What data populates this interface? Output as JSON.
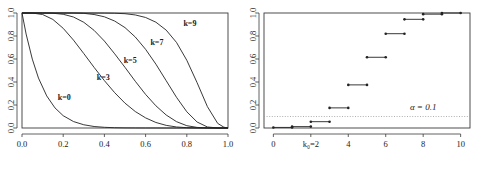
{
  "figure": {
    "background": "#ffffff",
    "ink_color": "#222222",
    "panel_count": 2
  },
  "chart_data": [
    {
      "type": "line",
      "panel": "left",
      "title": "",
      "xlabel": "",
      "ylabel": "",
      "xlim": [
        0.0,
        1.0
      ],
      "ylim": [
        0.0,
        1.0
      ],
      "grid": false,
      "legend": "inline-annotations",
      "xticks": [
        0.0,
        0.2,
        0.4,
        0.6,
        0.8,
        1.0
      ],
      "xtick_labels": [
        "0.0",
        "0.2",
        "0.4",
        "0.6",
        "0.8",
        "1.0"
      ],
      "yticks": [
        0.0,
        0.2,
        0.4,
        0.6,
        0.8,
        1.0
      ],
      "ytick_labels": [
        "0.0",
        "0.2",
        "0.4",
        "0.6",
        "0.8",
        "1.0"
      ],
      "annotations": [
        {
          "text": "k=0",
          "x": 0.205,
          "y": 0.245
        },
        {
          "text": "k=3",
          "x": 0.395,
          "y": 0.415
        },
        {
          "text": "k=5",
          "x": 0.525,
          "y": 0.565
        },
        {
          "text": "k=7",
          "x": 0.655,
          "y": 0.725
        },
        {
          "text": "k=9",
          "x": 0.815,
          "y": 0.885
        }
      ],
      "series": [
        {
          "name": "k=0",
          "x": [
            0.0,
            0.02,
            0.05,
            0.08,
            0.12,
            0.16,
            0.2,
            0.25,
            0.3,
            0.35,
            0.4,
            0.45,
            0.5,
            0.55,
            0.6,
            0.65,
            0.7,
            0.75,
            0.8,
            0.85,
            0.9,
            0.95,
            1.0
          ],
          "values": [
            1.0,
            0.817,
            0.599,
            0.434,
            0.279,
            0.175,
            0.107,
            0.056,
            0.028,
            0.013,
            0.006,
            0.0025,
            0.001,
            0.0004,
            0.0001,
            5e-05,
            2e-05,
            1e-05,
            0.0,
            0.0,
            0.0,
            0.0,
            0.0
          ]
        },
        {
          "name": "k=3",
          "x": [
            0.0,
            0.05,
            0.1,
            0.15,
            0.2,
            0.25,
            0.3,
            0.35,
            0.4,
            0.45,
            0.5,
            0.55,
            0.6,
            0.65,
            0.7,
            0.75,
            0.8,
            0.85,
            0.9,
            0.95,
            1.0
          ],
          "values": [
            1.0,
            0.9995,
            0.987,
            0.944,
            0.867,
            0.764,
            0.647,
            0.527,
            0.412,
            0.307,
            0.216,
            0.143,
            0.088,
            0.048,
            0.023,
            0.009,
            0.0028,
            0.0006,
            0.0001,
            0.0,
            0.0
          ]
        },
        {
          "name": "k=5",
          "x": [
            0.0,
            0.05,
            0.1,
            0.15,
            0.2,
            0.25,
            0.3,
            0.35,
            0.4,
            0.45,
            0.5,
            0.55,
            0.6,
            0.65,
            0.7,
            0.75,
            0.8,
            0.85,
            0.9,
            0.95,
            1.0
          ],
          "values": [
            1.0,
            1.0,
            0.9999,
            0.998,
            0.989,
            0.965,
            0.919,
            0.849,
            0.756,
            0.645,
            0.527,
            0.406,
            0.292,
            0.193,
            0.113,
            0.055,
            0.02,
            0.005,
            0.0005,
            0.0,
            0.0
          ]
        },
        {
          "name": "k=7",
          "x": [
            0.0,
            0.1,
            0.2,
            0.25,
            0.3,
            0.35,
            0.4,
            0.45,
            0.5,
            0.55,
            0.6,
            0.65,
            0.7,
            0.75,
            0.8,
            0.85,
            0.9,
            0.95,
            1.0
          ],
          "values": [
            1.0,
            1.0,
            0.9999,
            0.9996,
            0.997,
            0.987,
            0.967,
            0.93,
            0.873,
            0.791,
            0.684,
            0.555,
            0.411,
            0.267,
            0.141,
            0.052,
            0.009,
            0.0003,
            0.0
          ]
        },
        {
          "name": "k=9",
          "x": [
            0.0,
            0.1,
            0.2,
            0.3,
            0.4,
            0.45,
            0.5,
            0.55,
            0.6,
            0.65,
            0.7,
            0.75,
            0.8,
            0.85,
            0.9,
            0.95,
            0.98,
            1.0
          ],
          "values": [
            1.0,
            1.0,
            1.0,
            1.0,
            0.9994,
            0.998,
            0.994,
            0.983,
            0.961,
            0.92,
            0.851,
            0.744,
            0.589,
            0.394,
            0.186,
            0.04,
            0.007,
            0.0
          ]
        }
      ]
    },
    {
      "type": "line",
      "subtype": "step",
      "panel": "right",
      "title": "",
      "xlabel": "",
      "ylabel": "",
      "xlim": [
        -0.5,
        10.5
      ],
      "ylim": [
        0.0,
        1.0
      ],
      "grid": false,
      "xticks": [
        0,
        2,
        4,
        6,
        8,
        10
      ],
      "xtick_labels": [
        "0",
        "k₀=2",
        "4",
        "6",
        "8",
        "10"
      ],
      "yticks": [
        0.0,
        0.2,
        0.4,
        0.6,
        0.8,
        1.0
      ],
      "ytick_labels": [
        "0.0",
        "0.2",
        "0.4",
        "0.6",
        "0.8",
        "1.0"
      ],
      "reference_line": {
        "label": "α = 0.1",
        "value": 0.1,
        "orientation": "horizontal",
        "style": "dotted",
        "label_x": 8.0,
        "label_y": 0.155
      },
      "steps": [
        {
          "x_start": 0,
          "x_end": 1,
          "y": 0.005
        },
        {
          "x_start": 1,
          "x_end": 2,
          "y": 0.012
        },
        {
          "x_start": 2,
          "x_end": 3,
          "y": 0.055
        },
        {
          "x_start": 3,
          "x_end": 4,
          "y": 0.175
        },
        {
          "x_start": 4,
          "x_end": 5,
          "y": 0.375
        },
        {
          "x_start": 5,
          "x_end": 6,
          "y": 0.615
        },
        {
          "x_start": 6,
          "x_end": 7,
          "y": 0.82
        },
        {
          "x_start": 7,
          "x_end": 8,
          "y": 0.945
        },
        {
          "x_start": 8,
          "x_end": 9,
          "y": 0.99
        },
        {
          "x_start": 9,
          "x_end": 10,
          "y": 1.0
        }
      ]
    }
  ]
}
